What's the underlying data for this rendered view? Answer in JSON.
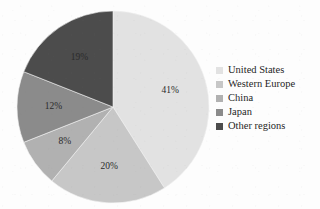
{
  "chart_data": {
    "type": "pie",
    "title": "",
    "subtitle": "",
    "xlabel": "",
    "ylabel": "",
    "categories": [
      "United States",
      "Western Europe",
      "China",
      "Japan",
      "Other regions"
    ],
    "values": [
      41,
      20,
      8,
      12,
      19
    ],
    "value_unit": "%",
    "data_labels": [
      "41%",
      "20%",
      "8%",
      "12%",
      "19%"
    ],
    "colors": [
      "#e2e2e2",
      "#c7c7c7",
      "#b1b1b1",
      "#8b8b8b",
      "#4c4c4c"
    ],
    "start_angle_deg": 0,
    "direction": "clockwise",
    "legend_position": "right",
    "grid": false,
    "slices": [
      {
        "label": "United States",
        "value": 41,
        "data_label": "41%",
        "color": "#e2e2e2"
      },
      {
        "label": "Western Europe",
        "value": 20,
        "data_label": "20%",
        "color": "#c7c7c7"
      },
      {
        "label": "China",
        "value": 8,
        "data_label": "8%",
        "color": "#b1b1b1"
      },
      {
        "label": "Japan",
        "value": 12,
        "data_label": "12%",
        "color": "#8b8b8b"
      },
      {
        "label": "Other regions",
        "value": 19,
        "data_label": "19%",
        "color": "#4c4c4c"
      }
    ]
  },
  "legend": {
    "items": [
      {
        "label": "United States",
        "color": "#e2e2e2"
      },
      {
        "label": "Western Europe",
        "color": "#c7c7c7"
      },
      {
        "label": "China",
        "color": "#b1b1b1"
      },
      {
        "label": "Japan",
        "color": "#8b8b8b"
      },
      {
        "label": "Other regions",
        "color": "#4c4c4c"
      }
    ]
  }
}
